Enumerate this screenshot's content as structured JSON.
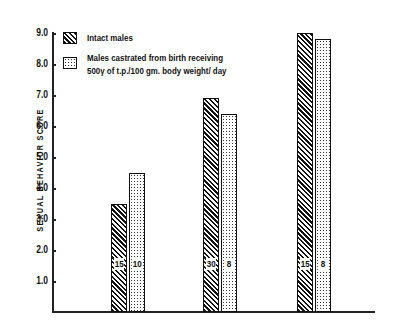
{
  "chart_data": {
    "type": "bar",
    "title": "",
    "xlabel": "",
    "ylabel": "SEXUAL BEHAVIOR SCORE",
    "ylim": [
      0,
      9.0
    ],
    "yticks": [
      "1.0",
      "2.0",
      "3.0",
      "4.0",
      "5.0",
      "6.0",
      "7.0",
      "8.0",
      "9.0"
    ],
    "categories": [
      "Group 1",
      "Group 2",
      "Group 3"
    ],
    "legend_position": "upper left",
    "grid": false,
    "series": [
      {
        "name": "Intact males",
        "pattern": "diagonal-hatch",
        "values": [
          3.5,
          6.9,
          9.0
        ],
        "n_labels": [
          "15",
          "30",
          "15"
        ]
      },
      {
        "name": "Males castrated from birth receiving 500γ of t.p./100 gm. body weight/ day",
        "pattern": "dots",
        "values": [
          4.5,
          6.4,
          8.8
        ],
        "n_labels": [
          "10",
          "8",
          "8"
        ]
      }
    ]
  },
  "legend": {
    "item1": "Intact males",
    "item2_line1": "Males castrated from birth receiving",
    "item2_line2": "500γ of t.p./100 gm. body weight/ day"
  }
}
